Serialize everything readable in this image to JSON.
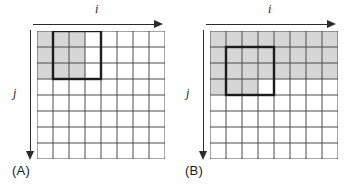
{
  "figure": {
    "background_color": "#ffffff",
    "grid_line_color": "#4a4a4a",
    "shade_color": "#d6d6d6",
    "highlight_color": "#1c1c1c",
    "arrow_color": "#2b2b2b",
    "cols": 8,
    "rows": 8,
    "cell_size": 16
  },
  "panels": [
    {
      "id": "A",
      "caption": "(A)",
      "axis_x_label": "i",
      "axis_y_label": "j",
      "shaded_cells": [
        [
          0,
          0
        ],
        [
          1,
          0
        ],
        [
          2,
          0
        ],
        [
          0,
          1
        ],
        [
          1,
          1
        ],
        [
          2,
          1
        ],
        [
          0,
          2
        ],
        [
          1,
          2
        ],
        [
          2,
          2
        ]
      ],
      "highlight_rect": {
        "col": 1,
        "row": 0,
        "width": 3,
        "height": 3
      }
    },
    {
      "id": "B",
      "caption": "(B)",
      "axis_x_label": "i",
      "axis_y_label": "j",
      "shaded_cells": [
        [
          0,
          0
        ],
        [
          1,
          0
        ],
        [
          2,
          0
        ],
        [
          3,
          0
        ],
        [
          4,
          0
        ],
        [
          5,
          0
        ],
        [
          6,
          0
        ],
        [
          7,
          0
        ],
        [
          0,
          1
        ],
        [
          1,
          1
        ],
        [
          2,
          1
        ],
        [
          3,
          1
        ],
        [
          4,
          1
        ],
        [
          5,
          1
        ],
        [
          6,
          1
        ],
        [
          7,
          1
        ],
        [
          0,
          2
        ],
        [
          1,
          2
        ],
        [
          2,
          2
        ],
        [
          3,
          2
        ],
        [
          4,
          2
        ],
        [
          5,
          2
        ],
        [
          6,
          2
        ],
        [
          7,
          2
        ],
        [
          0,
          3
        ],
        [
          1,
          3
        ],
        [
          2,
          3
        ]
      ],
      "highlight_rect": {
        "col": 1,
        "row": 1,
        "width": 3,
        "height": 3
      }
    }
  ]
}
